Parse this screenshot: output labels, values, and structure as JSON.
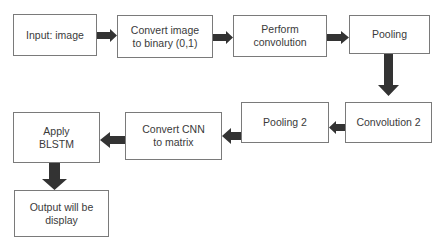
{
  "diagram": {
    "type": "flowchart",
    "colors": {
      "box_border": "#7a7a7a",
      "box_text": "#3a3a3a",
      "arrow_fill": "#333333",
      "background": "#ffffff"
    },
    "nodes": [
      {
        "id": "input",
        "label": "Input: image"
      },
      {
        "id": "binary",
        "label": "Convert image\nto binary (0,1)"
      },
      {
        "id": "conv1",
        "label": "Perform\nconvolution"
      },
      {
        "id": "pool1",
        "label": "Pooling"
      },
      {
        "id": "conv2",
        "label": "Convolution 2"
      },
      {
        "id": "pool2",
        "label": "Pooling 2"
      },
      {
        "id": "cnn2matrix",
        "label": "Convert CNN\nto matrix"
      },
      {
        "id": "blstm",
        "label": "Apply\nBLSTM"
      },
      {
        "id": "output",
        "label": "Output will be\ndisplay"
      }
    ],
    "edges": [
      {
        "from": "input",
        "to": "binary",
        "direction": "right"
      },
      {
        "from": "binary",
        "to": "conv1",
        "direction": "right"
      },
      {
        "from": "conv1",
        "to": "pool1",
        "direction": "right"
      },
      {
        "from": "pool1",
        "to": "conv2",
        "direction": "down"
      },
      {
        "from": "conv2",
        "to": "pool2",
        "direction": "left"
      },
      {
        "from": "pool2",
        "to": "cnn2matrix",
        "direction": "left"
      },
      {
        "from": "cnn2matrix",
        "to": "blstm",
        "direction": "left"
      },
      {
        "from": "blstm",
        "to": "output",
        "direction": "down"
      }
    ]
  }
}
